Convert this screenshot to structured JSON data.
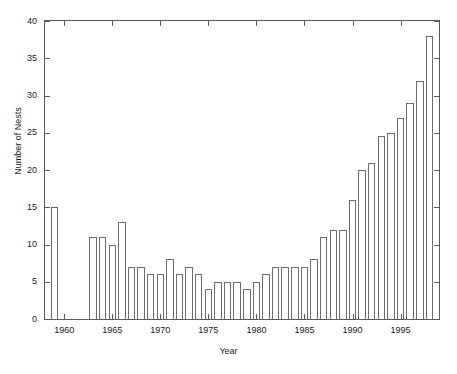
{
  "chart_data": {
    "type": "bar",
    "title": "",
    "xlabel": "Year",
    "ylabel": "Number of Nests",
    "xlim": [
      1958,
      1999
    ],
    "ylim": [
      0,
      40
    ],
    "grid": false,
    "legend": null,
    "y_ticks": [
      0,
      5,
      10,
      15,
      20,
      25,
      30,
      35,
      40
    ],
    "x_ticks": [
      1960,
      1965,
      1970,
      1975,
      1980,
      1985,
      1990,
      1995
    ],
    "bar_color": "#ffffff",
    "bar_edge_color": "#6e6e6e",
    "axis_color": "#5a5a5a",
    "categories": [
      1959,
      1963,
      1964,
      1965,
      1966,
      1967,
      1968,
      1969,
      1970,
      1971,
      1972,
      1973,
      1974,
      1975,
      1976,
      1977,
      1978,
      1979,
      1980,
      1981,
      1982,
      1983,
      1984,
      1985,
      1986,
      1987,
      1988,
      1989,
      1990,
      1991,
      1992,
      1993,
      1994,
      1995,
      1996,
      1997,
      1998
    ],
    "values": [
      15,
      11,
      11,
      10,
      13,
      7,
      7,
      6,
      6,
      8,
      6,
      7,
      6,
      4,
      5,
      5,
      5,
      4,
      5,
      6,
      7,
      7,
      7,
      7,
      8,
      11,
      12,
      12,
      16,
      20,
      21,
      24.5,
      25,
      27,
      29,
      32,
      38
    ],
    "missing_years": [
      1960,
      1961,
      1962
    ]
  }
}
